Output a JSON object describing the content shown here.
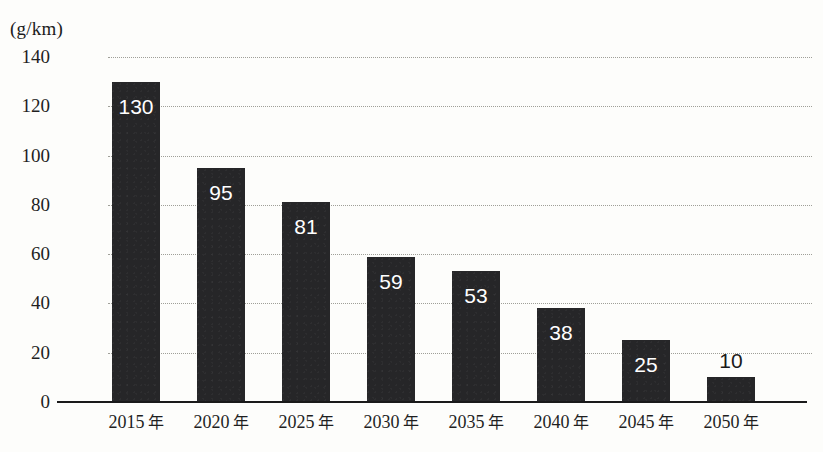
{
  "chart_data": {
    "type": "bar",
    "title": "",
    "subtitle": "",
    "xlabel": "",
    "ylabel": "",
    "unit_label": "(g/km)",
    "categories": [
      "2015 年",
      "2020 年",
      "2025 年",
      "2030 年",
      "2035 年",
      "2040 年",
      "2045 年",
      "2050 年"
    ],
    "category_numbers": [
      "2015",
      "2020",
      "2025",
      "2030",
      "2035",
      "2040",
      "2045",
      "2050"
    ],
    "category_suffix": "年",
    "values": [
      130,
      95,
      81,
      59,
      53,
      38,
      25,
      10
    ],
    "value_labels": [
      "130",
      "95",
      "81",
      "59",
      "53",
      "38",
      "25",
      "10"
    ],
    "label_placement": [
      "inside",
      "inside",
      "inside",
      "inside",
      "inside",
      "inside",
      "inside",
      "outside"
    ],
    "ylim": [
      0,
      140
    ],
    "yticks": [
      140,
      120,
      100,
      80,
      60,
      40,
      20,
      0
    ],
    "ytick_labels": [
      "140",
      "120",
      "100",
      "80",
      "60",
      "40",
      "20",
      "0"
    ],
    "grid": true,
    "grid_style": "dotted",
    "legend": false,
    "legend_position": "none",
    "bar_color": "#262628",
    "inside_label_color": "#ffffff",
    "outside_label_color": "#1a1a1a",
    "grid_color": "#9b9b93",
    "axis_color": "#1a1a1a",
    "background_color": "#fdfdfb"
  }
}
